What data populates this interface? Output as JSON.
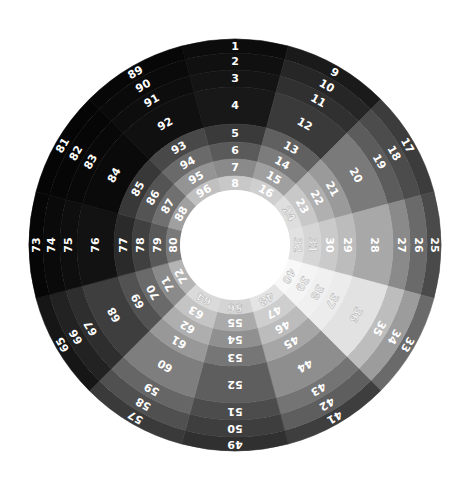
{
  "chart_data": {
    "type": "heatmap",
    "subtype": "radial-segmented-wheel",
    "title": "",
    "layout": {
      "center": [
        235,
        245
      ],
      "sectors": 12,
      "rings": 8,
      "ring_radii_outer_to_inner": [
        206,
        192,
        175,
        158,
        121,
        103,
        86,
        69,
        55
      ],
      "start_angle_deg": -15,
      "direction": "clockwise",
      "hole": true,
      "legend": "none",
      "grid": false
    },
    "sectors": [
      {
        "index": 0,
        "labels": [
          1,
          2,
          3,
          4,
          5,
          6,
          7,
          8
        ],
        "greys": [
          "#0c0c0c",
          "#101010",
          "#141414",
          "#181818",
          "#3a3a3a",
          "#5a5a5a",
          "#8a8a8a",
          "#c8c8c8"
        ]
      },
      {
        "index": 1,
        "labels": [
          9,
          10,
          11,
          12,
          13,
          14,
          15,
          16
        ],
        "greys": [
          "#1a1a1a",
          "#262626",
          "#303030",
          "#3a3a3a",
          "#606060",
          "#7c7c7c",
          "#a0a0a0",
          "#cfcfcf"
        ]
      },
      {
        "index": 2,
        "labels": [
          17,
          18,
          19,
          20,
          21,
          22,
          23,
          24
        ],
        "greys": [
          "#3c3c3c",
          "#4c4c4c",
          "#5c5c5c",
          "#7a7a7a",
          "#9a9a9a",
          "#b0b0b0",
          "#c8c8c8",
          "#dedede"
        ]
      },
      {
        "index": 3,
        "labels": [
          25,
          26,
          27,
          28,
          29,
          30,
          31,
          32
        ],
        "greys": [
          "#4a4a4a",
          "#6a6a6a",
          "#8a8a8a",
          "#a8a8a8",
          "#bcbcbc",
          "#cacaca",
          "#d6d6d6",
          "#e2e2e2"
        ]
      },
      {
        "index": 4,
        "labels": [
          33,
          34,
          35,
          36,
          37,
          38,
          39,
          40
        ],
        "greys": [
          "#6a6a6a",
          "#9c9c9c",
          "#bdbdbd",
          "#e2e2e2",
          "#ececec",
          "#f0f0f0",
          "#f4f4f4",
          "#f8f8f8"
        ]
      },
      {
        "index": 5,
        "labels": [
          41,
          42,
          43,
          44,
          45,
          46,
          47,
          48
        ],
        "greys": [
          "#3e3e3e",
          "#5e5e5e",
          "#747474",
          "#8e8e8e",
          "#a6a6a6",
          "#bcbcbc",
          "#cecece",
          "#e4e4e4"
        ]
      },
      {
        "index": 6,
        "labels": [
          49,
          50,
          51,
          52,
          53,
          54,
          55,
          56
        ],
        "greys": [
          "#303030",
          "#3e3e3e",
          "#4c4c4c",
          "#5e5e5e",
          "#767676",
          "#909090",
          "#aaaaaa",
          "#d4d4d4"
        ]
      },
      {
        "index": 7,
        "labels": [
          57,
          58,
          59,
          60,
          61,
          62,
          63,
          64
        ],
        "greys": [
          "#3a3a3a",
          "#505050",
          "#666666",
          "#7e7e7e",
          "#989898",
          "#aeaeae",
          "#c4c4c4",
          "#dadada"
        ]
      },
      {
        "index": 8,
        "labels": [
          65,
          66,
          67,
          68,
          69,
          70,
          71,
          72
        ],
        "greys": [
          "#161616",
          "#222222",
          "#2e2e2e",
          "#3e3e3e",
          "#525252",
          "#6a6a6a",
          "#8a8a8a",
          "#b4b4b4"
        ]
      },
      {
        "index": 9,
        "labels": [
          73,
          74,
          75,
          76,
          77,
          78,
          79,
          80
        ],
        "greys": [
          "#060606",
          "#0a0a0a",
          "#0e0e0e",
          "#121212",
          "#2a2a2a",
          "#404040",
          "#585858",
          "#7a7a7a"
        ]
      },
      {
        "index": 10,
        "labels": [
          81,
          82,
          83,
          84,
          85,
          86,
          87,
          88
        ],
        "greys": [
          "#050505",
          "#060606",
          "#080808",
          "#0a0a0a",
          "#383838",
          "#545454",
          "#707070",
          "#a0a0a0"
        ]
      },
      {
        "index": 11,
        "labels": [
          89,
          90,
          91,
          92,
          93,
          94,
          95,
          96
        ],
        "greys": [
          "#070707",
          "#0a0a0a",
          "#0d0d0d",
          "#101010",
          "#484848",
          "#6a6a6a",
          "#949494",
          "#c0c0c0"
        ]
      }
    ],
    "label_color": "#ffffff"
  }
}
